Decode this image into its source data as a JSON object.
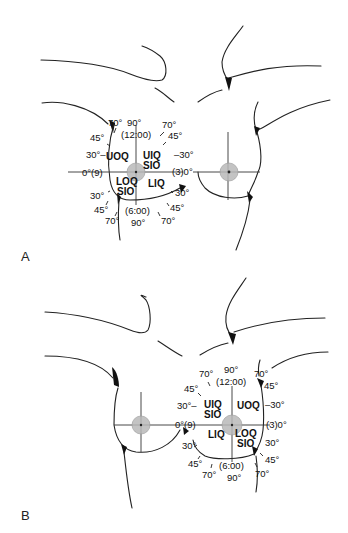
{
  "panels": [
    {
      "label": "A",
      "quadrants": {
        "upper_outer": "UOQ",
        "upper_inner": "UIQ",
        "upper_inner_sub": "SIO",
        "lower_outer": "LOQ",
        "lower_outer_sub": "SIO",
        "lower_inner": "LIQ"
      },
      "clock": {
        "top": "(12:00)",
        "bottom": "(6:00)",
        "left": "0°(9)",
        "right": "(3)0°"
      },
      "angles": {
        "top_center": "90°",
        "bottom_center": "90°",
        "top_left_70": "70°",
        "top_right_70": "70°",
        "left_45_upper": "45°",
        "right_45_upper": "45°",
        "left_30_upper": "30°–",
        "right_30_upper": "–30°",
        "left_30_lower": "30°",
        "right_30_lower": "30°",
        "left_45_lower": "45°",
        "right_45_lower": "45°",
        "bottom_left_70": "70°",
        "bottom_right_70": "70°"
      }
    },
    {
      "label": "B",
      "quadrants": {
        "upper_inner": "UIQ",
        "upper_inner_sub": "SIO",
        "upper_outer": "UOQ",
        "lower_inner": "LIQ",
        "lower_outer": "LOQ",
        "lower_outer_sub": "SIO"
      },
      "clock": {
        "top": "(12:00)",
        "bottom": "(6:00)",
        "left": "0°(9)",
        "right": "(3)0°"
      },
      "angles": {
        "top_center": "90°",
        "bottom_center": "90°",
        "top_left_70": "70°",
        "top_right_70": "70°",
        "left_45_upper": "45°",
        "right_45_upper": "45°",
        "left_30_upper": "30°–",
        "right_30_upper": "–30°",
        "left_30_lower": "30°",
        "right_30_lower": "30°",
        "left_45_lower": "45°",
        "right_45_lower": "45°",
        "bottom_left_70": "70°",
        "bottom_right_70": "70°"
      }
    }
  ],
  "colors": {
    "line": "#222222",
    "areola": "#b8b8b8",
    "background": "#ffffff"
  }
}
